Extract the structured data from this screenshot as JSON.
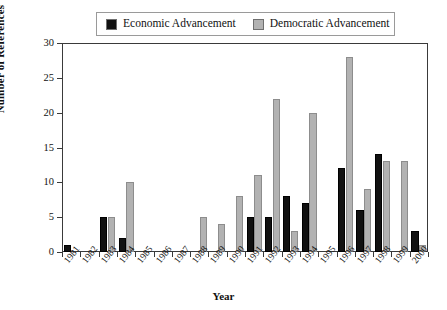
{
  "legend": {
    "entries": [
      {
        "label": "Economic Advancement",
        "color": "#111111",
        "icon": "filled-square-icon"
      },
      {
        "label": "Democratic Advancement",
        "color": "#b2b2b2",
        "icon": "filled-square-icon"
      }
    ]
  },
  "chart_data": {
    "type": "bar",
    "title": "",
    "xlabel": "Year",
    "ylabel": "Number of References",
    "categories": [
      "1981",
      "1982",
      "1983",
      "1984",
      "1985",
      "1986",
      "1987",
      "1988",
      "1989",
      "1990",
      "1991",
      "1992",
      "1993",
      "1994",
      "1995",
      "1996",
      "1997",
      "1998",
      "1999",
      "2000"
    ],
    "series": [
      {
        "name": "Economic Advancement",
        "color": "#111111",
        "values": [
          1,
          0,
          5,
          2,
          0,
          0,
          0,
          0,
          0,
          0,
          5,
          5,
          8,
          7,
          0,
          12,
          6,
          14,
          0,
          3
        ]
      },
      {
        "name": "Democratic Advancement",
        "color": "#b2b2b2",
        "values": [
          0,
          0,
          5,
          10,
          0,
          0,
          0,
          5,
          4,
          8,
          11,
          22,
          3,
          20,
          0,
          28,
          9,
          13,
          13,
          1
        ]
      }
    ],
    "ylim": [
      0,
      30
    ],
    "yticks": [
      0,
      5,
      10,
      15,
      20,
      25,
      30
    ],
    "grid": false,
    "legend_position": "top-center"
  }
}
